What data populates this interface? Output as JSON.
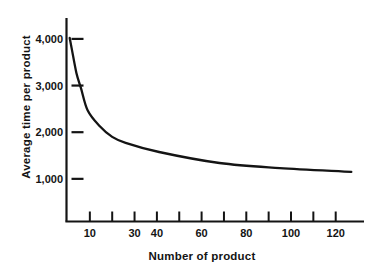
{
  "figure": {
    "background": "#ffffff",
    "ink": "#141414"
  },
  "chart_data": {
    "type": "line",
    "title": "",
    "xlabel": "Number of product",
    "ylabel": "Average time per product",
    "xlim": [
      0,
      133
    ],
    "ylim": [
      0,
      4450
    ],
    "grid": false,
    "legend": false,
    "x_ticks": [
      {
        "value": 10,
        "label": "10"
      },
      {
        "value": 20,
        "label": ""
      },
      {
        "value": 30,
        "label": "30"
      },
      {
        "value": 40,
        "label": "40"
      },
      {
        "value": 50,
        "label": ""
      },
      {
        "value": 60,
        "label": "60"
      },
      {
        "value": 70,
        "label": ""
      },
      {
        "value": 80,
        "label": "80"
      },
      {
        "value": 90,
        "label": ""
      },
      {
        "value": 100,
        "label": "100"
      },
      {
        "value": 110,
        "label": ""
      },
      {
        "value": 120,
        "label": "120"
      }
    ],
    "y_ticks": [
      {
        "value": 4000,
        "label": "4,000"
      },
      {
        "value": 3000,
        "label": "3,000"
      },
      {
        "value": 2000,
        "label": "2,000"
      },
      {
        "value": 1000,
        "label": "1,000"
      }
    ],
    "series": [
      {
        "name": "average-time-per-product",
        "points": [
          [
            1,
            4020
          ],
          [
            2,
            3760
          ],
          [
            4,
            3270
          ],
          [
            6,
            2950
          ],
          [
            9,
            2470
          ],
          [
            14,
            2150
          ],
          [
            20,
            1900
          ],
          [
            26,
            1770
          ],
          [
            41,
            1575
          ],
          [
            68,
            1340
          ],
          [
            95,
            1230
          ],
          [
            127,
            1150
          ]
        ]
      }
    ]
  }
}
